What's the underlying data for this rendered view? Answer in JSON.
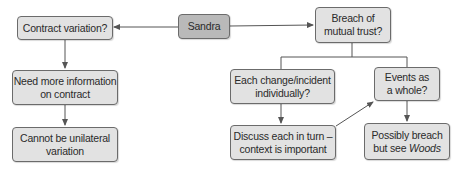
{
  "diagram": {
    "type": "flowchart",
    "colors": {
      "node_fill": "#e2e2e2",
      "root_fill": "#b9b9b9",
      "border": "#6b6b6b",
      "line": "#555555"
    },
    "nodes": {
      "sandra": {
        "label": "Sandra"
      },
      "contract_variation": {
        "label": "Contract variation?"
      },
      "breach_mutual_trust": {
        "line1": "Breach of",
        "line2": "mutual trust?"
      },
      "need_more_info": {
        "line1": "Need more information",
        "line2": "on contract"
      },
      "cannot_unilateral": {
        "line1": "Cannot be unilateral",
        "line2": "variation"
      },
      "each_change": {
        "line1": "Each change/incident",
        "line2": "individually?"
      },
      "events_whole": {
        "line1": "Events as",
        "line2": "a whole?"
      },
      "discuss_each": {
        "line1": "Discuss each in turn –",
        "line2": "context is important"
      },
      "possibly_breach": {
        "line1": "Possibly breach",
        "line2a": "but see ",
        "line2b": "Woods"
      }
    },
    "edges": [
      {
        "from": "Sandra",
        "to": "Contract variation?"
      },
      {
        "from": "Sandra",
        "to": "Breach of mutual trust?"
      },
      {
        "from": "Contract variation?",
        "to": "Need more information on contract"
      },
      {
        "from": "Need more information on contract",
        "to": "Cannot be unilateral variation"
      },
      {
        "from": "Breach of mutual trust?",
        "to": "Each change/incident individually?"
      },
      {
        "from": "Breach of mutual trust?",
        "to": "Events as a whole?"
      },
      {
        "from": "Each change/incident individually?",
        "to": "Discuss each in turn – context is important"
      },
      {
        "from": "Discuss each in turn – context is important",
        "to": "Events as a whole?"
      },
      {
        "from": "Events as a whole?",
        "to": "Possibly breach but see Woods"
      }
    ]
  }
}
